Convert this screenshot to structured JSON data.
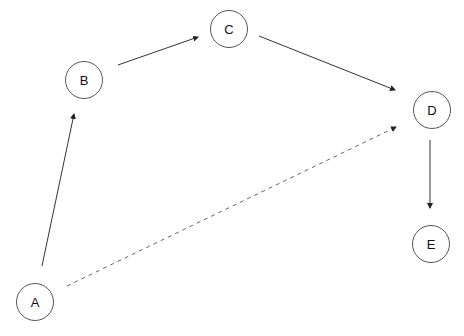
{
  "diagram": {
    "type": "directed-graph",
    "nodes": [
      {
        "id": "A",
        "label": "A"
      },
      {
        "id": "B",
        "label": "B"
      },
      {
        "id": "C",
        "label": "C"
      },
      {
        "id": "D",
        "label": "D"
      },
      {
        "id": "E",
        "label": "E"
      }
    ],
    "edges": [
      {
        "from": "A",
        "to": "B",
        "style": "solid"
      },
      {
        "from": "B",
        "to": "C",
        "style": "solid"
      },
      {
        "from": "C",
        "to": "D",
        "style": "solid"
      },
      {
        "from": "D",
        "to": "E",
        "style": "solid"
      },
      {
        "from": "A",
        "to": "D",
        "style": "dashed"
      }
    ]
  }
}
